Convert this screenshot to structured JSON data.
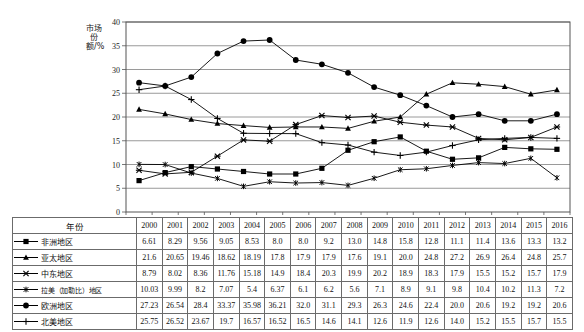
{
  "chart_data": {
    "type": "line",
    "title": "",
    "xlabel": "",
    "ylabel": "市场份额/%",
    "ylim": [
      0,
      40
    ],
    "ytick_step": 5,
    "yticks": [
      "0",
      "5",
      "10",
      "15",
      "20",
      "25",
      "30",
      "35",
      "40"
    ],
    "grid": true,
    "legend_position": "table-left-column",
    "categories": [
      "2000",
      "2001",
      "2002",
      "2003",
      "2004",
      "2005",
      "2006",
      "2007",
      "2008",
      "2009",
      "2010",
      "2011",
      "2012",
      "2013",
      "2014",
      "2015",
      "2016"
    ],
    "series": [
      {
        "name": "非洲地区",
        "marker": "square",
        "values": [
          6.61,
          8.29,
          9.56,
          9.05,
          8.53,
          8.0,
          8.0,
          9.2,
          13.0,
          14.8,
          15.8,
          12.8,
          11.1,
          11.4,
          13.6,
          13.3,
          13.2
        ]
      },
      {
        "name": "亚太地区",
        "marker": "triangle",
        "values": [
          21.6,
          20.65,
          19.46,
          18.62,
          18.19,
          17.8,
          17.9,
          17.9,
          17.6,
          19.1,
          20.0,
          24.8,
          27.2,
          26.9,
          26.4,
          24.8,
          25.7
        ]
      },
      {
        "name": "中东地区",
        "marker": "x-bar",
        "values": [
          8.79,
          8.02,
          8.36,
          11.76,
          15.18,
          14.9,
          18.4,
          20.3,
          19.9,
          20.2,
          18.9,
          18.3,
          17.9,
          15.5,
          15.2,
          15.7,
          17.9
        ]
      },
      {
        "name": "拉美（加勒比）地区",
        "marker": "star",
        "values": [
          10.03,
          9.99,
          8.2,
          7.07,
          5.4,
          6.37,
          6.1,
          6.2,
          5.6,
          7.1,
          8.9,
          9.1,
          9.8,
          10.4,
          10.2,
          11.3,
          7.2
        ]
      },
      {
        "name": "欧洲地区",
        "marker": "circle",
        "values": [
          27.23,
          26.54,
          28.4,
          33.37,
          35.98,
          36.21,
          32.0,
          31.1,
          29.3,
          26.3,
          24.6,
          22.4,
          20.0,
          20.6,
          19.2,
          19.2,
          20.6
        ]
      },
      {
        "name": "北美地区",
        "marker": "plus",
        "values": [
          25.75,
          26.52,
          23.67,
          19.7,
          16.57,
          16.52,
          16.5,
          14.6,
          14.1,
          12.6,
          11.9,
          12.6,
          14.0,
          15.2,
          15.5,
          15.7,
          15.5
        ]
      }
    ]
  },
  "table": {
    "header_label": "年份",
    "years": [
      "2000",
      "2001",
      "2002",
      "2003",
      "2004",
      "2005",
      "2006",
      "2007",
      "2008",
      "2009",
      "2010",
      "2011",
      "2012",
      "2013",
      "2014",
      "2015",
      "2016"
    ],
    "rows": [
      {
        "label": "非洲地区",
        "marker": "square",
        "values": [
          "6.61",
          "8.29",
          "9.56",
          "9.05",
          "8.53",
          "8.0",
          "8.0",
          "9.2",
          "13.0",
          "14.8",
          "15.8",
          "12.8",
          "11.1",
          "11.4",
          "13.6",
          "13.3",
          "13.2"
        ]
      },
      {
        "label": "亚太地区",
        "marker": "triangle",
        "values": [
          "21.6",
          "20.65",
          "19.46",
          "18.62",
          "18.19",
          "17.8",
          "17.9",
          "17.9",
          "17.6",
          "19.1",
          "20.0",
          "24.8",
          "27.2",
          "26.9",
          "26.4",
          "24.8",
          "25.7"
        ]
      },
      {
        "label": "中东地区",
        "marker": "x-bar",
        "values": [
          "8.79",
          "8.02",
          "8.36",
          "11.76",
          "15.18",
          "14.9",
          "18.4",
          "20.3",
          "19.9",
          "20.2",
          "18.9",
          "18.3",
          "17.9",
          "15.5",
          "15.2",
          "15.7",
          "17.9"
        ]
      },
      {
        "label": "拉美（加勒比）地区",
        "marker": "star",
        "values": [
          "10.03",
          "9.99",
          "8.2",
          "7.07",
          "5.4",
          "6.37",
          "6.1",
          "6.2",
          "5.6",
          "7.1",
          "8.9",
          "9.1",
          "9.8",
          "10.4",
          "10.2",
          "11.3",
          "7.2"
        ]
      },
      {
        "label": "欧洲地区",
        "marker": "circle",
        "values": [
          "27.23",
          "26.54",
          "28.4",
          "33.37",
          "35.98",
          "36.21",
          "32.0",
          "31.1",
          "29.3",
          "26.3",
          "24.6",
          "22.4",
          "20.0",
          "20.6",
          "19.2",
          "19.2",
          "20.6"
        ]
      },
      {
        "label": "北美地区",
        "marker": "plus",
        "values": [
          "25.75",
          "26.52",
          "23.67",
          "19.7",
          "16.57",
          "16.52",
          "16.5",
          "14.6",
          "14.1",
          "12.6",
          "11.9",
          "12.6",
          "14.0",
          "15.2",
          "15.5",
          "15.7",
          "15.5"
        ]
      }
    ]
  },
  "colors": {
    "line": "#000000",
    "grid": "#808080",
    "axis": "#555555",
    "border": "#6b6b6b",
    "text": "#111111"
  }
}
